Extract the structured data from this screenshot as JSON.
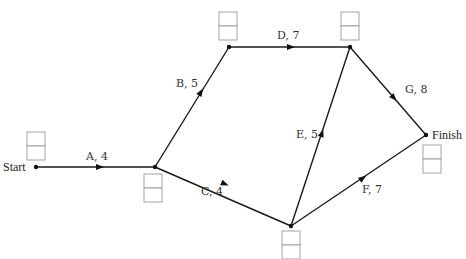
{
  "diagram": {
    "type": "activity-network",
    "nodes": [
      {
        "id": "start",
        "label": "Start",
        "x": 36,
        "y": 167,
        "box": {
          "x": 27,
          "y": 132
        }
      },
      {
        "id": "n2",
        "label": "",
        "x": 155,
        "y": 167,
        "box": {
          "x": 145,
          "y": 173
        }
      },
      {
        "id": "n3",
        "label": "",
        "x": 229,
        "y": 47,
        "box": {
          "x": 219,
          "y": 12
        }
      },
      {
        "id": "n4",
        "label": "",
        "x": 350,
        "y": 47,
        "box": {
          "x": 341,
          "y": 12
        }
      },
      {
        "id": "n5",
        "label": "",
        "x": 291,
        "y": 226,
        "box": {
          "x": 282,
          "y": 231
        }
      },
      {
        "id": "finish",
        "label": "Finish",
        "x": 426,
        "y": 135,
        "box": {
          "x": 423,
          "y": 145
        }
      }
    ],
    "edges": [
      {
        "activity": "A",
        "duration": "4",
        "text": "A, 4",
        "from": "start",
        "to": "n2"
      },
      {
        "activity": "B",
        "duration": "5",
        "text": "B, 5",
        "from": "n2",
        "to": "n3"
      },
      {
        "activity": "C",
        "duration": "4",
        "text": "C, 4",
        "from": "n2",
        "to": "n5"
      },
      {
        "activity": "D",
        "duration": "7",
        "text": "D, 7",
        "from": "n3",
        "to": "n4"
      },
      {
        "activity": "E",
        "duration": "5",
        "text": "E, 5",
        "from": "n5",
        "to": "n4"
      },
      {
        "activity": "F",
        "duration": "7",
        "text": "F, 7",
        "from": "n5",
        "to": "finish"
      },
      {
        "activity": "G",
        "duration": "8",
        "text": "G, 8",
        "from": "n4",
        "to": "finish"
      }
    ]
  },
  "labels": {
    "start": "Start",
    "finish": "Finish",
    "A": "A, 4",
    "B": "B, 5",
    "C": "C, 4",
    "D": "D, 7",
    "E": "E, 5",
    "F": "F, 7",
    "G": "G, 8"
  }
}
